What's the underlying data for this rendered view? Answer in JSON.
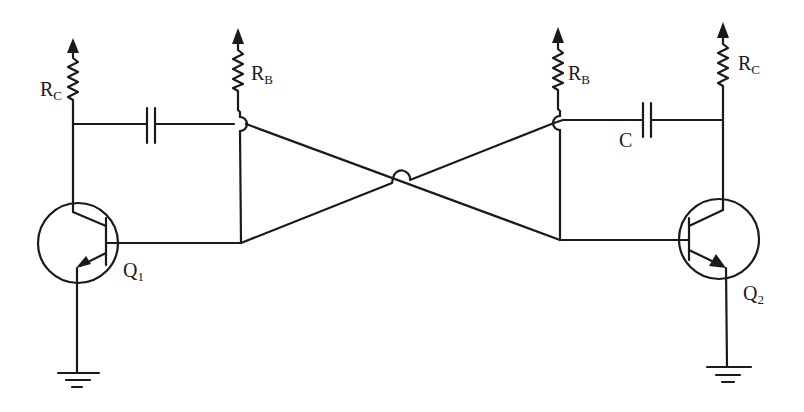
{
  "diagram": {
    "type": "astable-multivibrator-schematic",
    "labels": {
      "rc_left": "R",
      "rc_left_sub": "C",
      "rb_left": "R",
      "rb_left_sub": "B",
      "rb_right": "R",
      "rb_right_sub": "B",
      "rc_right": "R",
      "rc_right_sub": "C",
      "cap_right": "C",
      "q1": "Q",
      "q1_sub": "1",
      "q2": "Q",
      "q2_sub": "2"
    },
    "components": [
      {
        "id": "RC1",
        "kind": "resistor",
        "label": "RC"
      },
      {
        "id": "RB1",
        "kind": "resistor",
        "label": "RB"
      },
      {
        "id": "C1",
        "kind": "capacitor",
        "label": ""
      },
      {
        "id": "RB2",
        "kind": "resistor",
        "label": "RB"
      },
      {
        "id": "C2",
        "kind": "capacitor",
        "label": "C"
      },
      {
        "id": "RC2",
        "kind": "resistor",
        "label": "RC"
      },
      {
        "id": "Q1",
        "kind": "npn-transistor",
        "label": "Q1"
      },
      {
        "id": "Q2",
        "kind": "npn-transistor",
        "label": "Q2"
      },
      {
        "id": "GND1",
        "kind": "ground"
      },
      {
        "id": "GND2",
        "kind": "ground"
      }
    ],
    "colors": {
      "ink": "#1a1a1a",
      "background": "#ffffff"
    }
  }
}
